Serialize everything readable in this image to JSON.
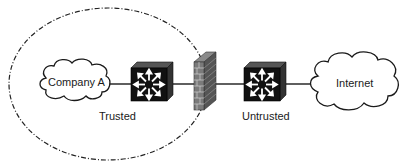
{
  "diagram": {
    "nodes": [
      {
        "id": "company-a",
        "type": "cloud",
        "label": "Company A"
      },
      {
        "id": "switch-trusted",
        "type": "layer3-switch"
      },
      {
        "id": "firewall",
        "type": "firewall"
      },
      {
        "id": "switch-untrusted",
        "type": "layer3-switch"
      },
      {
        "id": "internet",
        "type": "cloud",
        "label": "Internet"
      }
    ],
    "links": [
      [
        "company-a",
        "switch-trusted"
      ],
      [
        "switch-trusted",
        "firewall"
      ],
      [
        "firewall",
        "switch-untrusted"
      ],
      [
        "switch-untrusted",
        "internet"
      ]
    ],
    "zones": {
      "trusted": {
        "label": "Trusted",
        "boundary": "dash-dot ellipse"
      },
      "untrusted": {
        "label": "Untrusted"
      }
    },
    "colors": {
      "line": "#1a1a1a",
      "switch_face": "#111111",
      "firewall_brick": "#6e6e6e"
    }
  }
}
